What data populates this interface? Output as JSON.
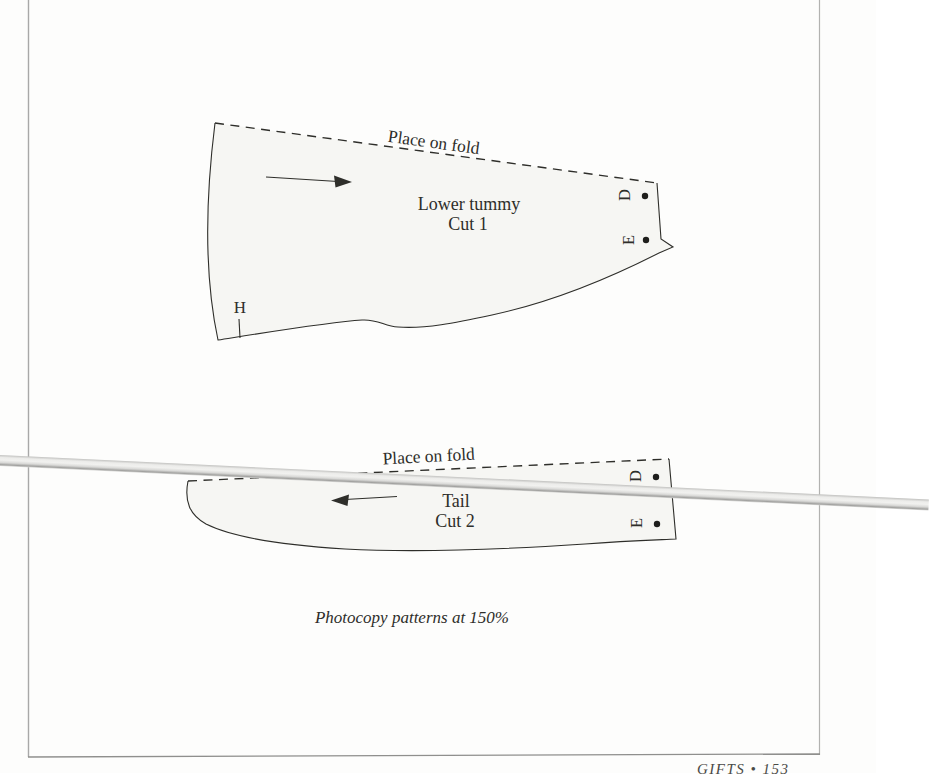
{
  "page": {
    "caption": "Photocopy patterns at 150%",
    "footer": "GIFTS • 153"
  },
  "colors": {
    "page_bg": "#fdfdfc",
    "pattern_fill": "#f6f6f3",
    "outline": "#2e2e2a",
    "page_border": "#a8a8a8",
    "glare_band_light": "#f1f1ef",
    "glare_band_dark": "#a2a2a0"
  },
  "lower_tummy": {
    "fold_label": "Place on fold",
    "title": "Lower tummy",
    "cut": "Cut 1",
    "marker_h": "H",
    "marker_d": "D",
    "marker_e": "E"
  },
  "tail": {
    "fold_label": "Place on fold",
    "title": "Tail",
    "cut": "Cut 2",
    "marker_d": "D",
    "marker_e": "E"
  }
}
